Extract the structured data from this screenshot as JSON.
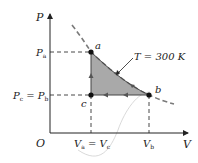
{
  "diagram": {
    "type": "pV-diagram",
    "axes": {
      "y_label": "P",
      "x_label": "V",
      "origin_label": "O"
    },
    "points": [
      {
        "id": "a",
        "label": "a"
      },
      {
        "id": "b",
        "label": "b"
      },
      {
        "id": "c",
        "label": "c"
      }
    ],
    "y_ticks": [
      {
        "main": "P",
        "sub": "a",
        "text": "Pa"
      },
      {
        "main": "P",
        "sub": "c",
        "eq_main": "P",
        "eq_sub": "b",
        "text": "Pc = Pb"
      }
    ],
    "x_ticks": [
      {
        "main": "V",
        "sub": "a",
        "eq_main": "V",
        "eq_sub": "c",
        "text": "Va = Vc"
      },
      {
        "main": "V",
        "sub": "b",
        "text": "Vb"
      }
    ],
    "isotherm_label": "T = 300 K",
    "colors": {
      "shade": "#a9a9a9",
      "isotherm": "#7a7a7a",
      "axes": "#222222",
      "dash": "#333333",
      "stray_curve": "#c8c8c8"
    },
    "cycle": [
      "a",
      "b",
      "c",
      "a"
    ]
  }
}
